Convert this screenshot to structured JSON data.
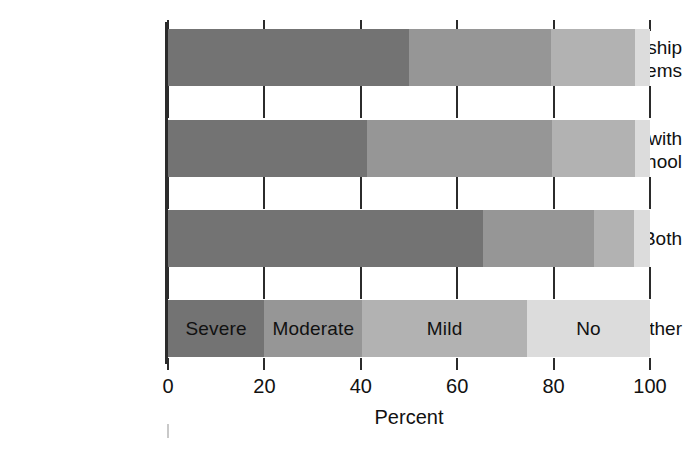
{
  "chart_data": {
    "type": "bar",
    "orientation": "horizontal",
    "stacked": true,
    "title": "",
    "xlabel": "Percent",
    "ylabel": "",
    "xlim": [
      0,
      100
    ],
    "xticks": [
      0,
      20,
      40,
      60,
      80,
      100
    ],
    "xtick_labels": [
      "0",
      "20",
      "40",
      "60",
      "80",
      "100"
    ],
    "grid": false,
    "legend_position": "inline-on-bottom-bar",
    "categories": [
      "Relationship problems",
      "Problems with work/school",
      "Both",
      "Neither"
    ],
    "category_label_lines": [
      [
        "Relationship",
        "problems"
      ],
      [
        "Problems with",
        "work/school"
      ],
      [
        "Both"
      ],
      [
        "Neither"
      ]
    ],
    "series": [
      {
        "name": "Severe",
        "color": "#737373",
        "values": [
          50.0,
          41.3,
          65.4,
          20.0
        ]
      },
      {
        "name": "Moderate",
        "color": "#969696",
        "values": [
          29.5,
          38.4,
          22.9,
          20.3
        ]
      },
      {
        "name": "Mild",
        "color": "#b2b2b2",
        "values": [
          17.4,
          17.2,
          8.7,
          34.2
        ]
      },
      {
        "name": "No",
        "color": "#dcdcdc",
        "values": [
          3.1,
          3.1,
          3.0,
          25.5
        ]
      }
    ],
    "bars": [
      {
        "category": "Relationship problems",
        "segments": [
          {
            "label": "Severe",
            "value": 50.0,
            "start": 0.0,
            "end": 50.0,
            "color": "#737373",
            "show_label": false
          },
          {
            "label": "Moderate",
            "value": 29.5,
            "start": 50.0,
            "end": 79.5,
            "color": "#969696",
            "show_label": false
          },
          {
            "label": "Mild",
            "value": 17.4,
            "start": 79.5,
            "end": 96.9,
            "color": "#b2b2b2",
            "show_label": false
          },
          {
            "label": "No",
            "value": 3.1,
            "start": 96.9,
            "end": 100.0,
            "color": "#dcdcdc",
            "show_label": false
          }
        ]
      },
      {
        "category": "Problems with work/school",
        "segments": [
          {
            "label": "Severe",
            "value": 41.3,
            "start": 0.0,
            "end": 41.3,
            "color": "#737373",
            "show_label": false
          },
          {
            "label": "Moderate",
            "value": 38.4,
            "start": 41.3,
            "end": 79.7,
            "color": "#969696",
            "show_label": false
          },
          {
            "label": "Mild",
            "value": 17.2,
            "start": 79.7,
            "end": 96.9,
            "color": "#b2b2b2",
            "show_label": false
          },
          {
            "label": "No",
            "value": 3.1,
            "start": 96.9,
            "end": 100.0,
            "color": "#dcdcdc",
            "show_label": false
          }
        ]
      },
      {
        "category": "Both",
        "segments": [
          {
            "label": "Severe",
            "value": 65.4,
            "start": 0.0,
            "end": 65.4,
            "color": "#737373",
            "show_label": false
          },
          {
            "label": "Moderate",
            "value": 22.9,
            "start": 65.4,
            "end": 88.3,
            "color": "#969696",
            "show_label": false
          },
          {
            "label": "Mild",
            "value": 8.4,
            "start": 88.3,
            "end": 96.7,
            "color": "#b2b2b2",
            "show_label": false
          },
          {
            "label": "No",
            "value": 3.3,
            "start": 96.7,
            "end": 100.0,
            "color": "#dcdcdc",
            "show_label": false
          }
        ]
      },
      {
        "category": "Neither",
        "segments": [
          {
            "label": "Severe",
            "value": 20.0,
            "start": 0.0,
            "end": 20.0,
            "color": "#737373",
            "show_label": true
          },
          {
            "label": "Moderate",
            "value": 20.3,
            "start": 20.0,
            "end": 40.3,
            "color": "#969696",
            "show_label": true
          },
          {
            "label": "Mild",
            "value": 34.2,
            "start": 40.3,
            "end": 74.5,
            "color": "#b2b2b2",
            "show_label": true
          },
          {
            "label": "No",
            "value": 25.5,
            "start": 74.5,
            "end": 100.0,
            "color": "#dcdcdc",
            "show_label": true
          }
        ]
      }
    ],
    "legend_entries": [
      "Severe",
      "Moderate",
      "Mild",
      "No"
    ]
  },
  "axis": {
    "x_title": "Percent",
    "tick_labels": [
      "0",
      "20",
      "40",
      "60",
      "80",
      "100"
    ]
  },
  "labels": {
    "cat0_line0": "Relationship",
    "cat0_line1": "problems",
    "cat1_line0": "Problems with",
    "cat1_line1": "work/school",
    "cat2_line0": "Both",
    "cat3_line0": "Neither"
  },
  "segment_labels": {
    "severe": "Severe",
    "moderate": "Moderate",
    "mild": "Mild",
    "no": "No"
  },
  "colors": {
    "severe": "#737373",
    "moderate": "#969696",
    "mild": "#b2b2b2",
    "no": "#dcdcdc",
    "axis": "#2b2b2b",
    "text": "#111111",
    "background": "#ffffff"
  }
}
